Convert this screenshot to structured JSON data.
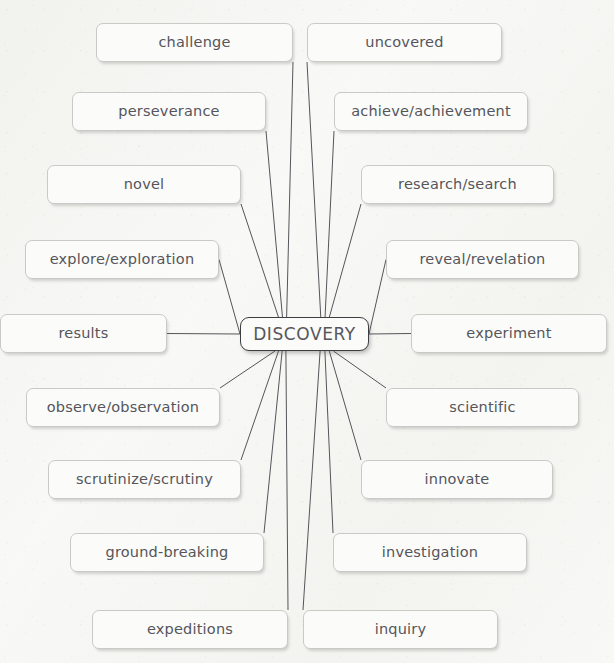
{
  "diagram": {
    "type": "mind-map",
    "background_color": "#f8f8f6",
    "node_fill": "#fbfbfa",
    "node_border": "#c9c9c6",
    "center_border": "#3e3e42",
    "text_color": "#55555a",
    "edge_color": "#55555a"
  },
  "center": {
    "label": "DISCOVERY",
    "x": 240,
    "y": 317,
    "width": 129,
    "height": 34
  },
  "nodes": [
    {
      "id": "challenge",
      "label": "challenge",
      "x": 96,
      "y": 23,
      "width": 197,
      "height": 39,
      "side": "left",
      "anchor": "bottom-right"
    },
    {
      "id": "uncovered",
      "label": "uncovered",
      "x": 307,
      "y": 23,
      "width": 195,
      "height": 39,
      "side": "right",
      "anchor": "bottom-left"
    },
    {
      "id": "perseverance",
      "label": "perseverance",
      "x": 72,
      "y": 92,
      "width": 194,
      "height": 39,
      "side": "left",
      "anchor": "bottom-right"
    },
    {
      "id": "achieve",
      "label": "achieve/achievement",
      "x": 334,
      "y": 92,
      "width": 194,
      "height": 39,
      "side": "right",
      "anchor": "bottom-left"
    },
    {
      "id": "novel",
      "label": "novel",
      "x": 47,
      "y": 165,
      "width": 194,
      "height": 39,
      "side": "left",
      "anchor": "bottom-right"
    },
    {
      "id": "research",
      "label": "research/search",
      "x": 361,
      "y": 165,
      "width": 193,
      "height": 39,
      "side": "right",
      "anchor": "bottom-left"
    },
    {
      "id": "explore",
      "label": "explore/exploration",
      "x": 25,
      "y": 240,
      "width": 194,
      "height": 39,
      "side": "left",
      "anchor": "right"
    },
    {
      "id": "reveal",
      "label": "reveal/revelation",
      "x": 386,
      "y": 240,
      "width": 193,
      "height": 39,
      "side": "right",
      "anchor": "left"
    },
    {
      "id": "results",
      "label": "results",
      "x": 0,
      "y": 314,
      "width": 167,
      "height": 39,
      "side": "left",
      "anchor": "right"
    },
    {
      "id": "experiment",
      "label": "experiment",
      "x": 411,
      "y": 314,
      "width": 196,
      "height": 39,
      "side": "right",
      "anchor": "left"
    },
    {
      "id": "observe",
      "label": "observe/observation",
      "x": 26,
      "y": 388,
      "width": 194,
      "height": 39,
      "side": "left",
      "anchor": "top-right"
    },
    {
      "id": "scientific",
      "label": "scientific",
      "x": 386,
      "y": 388,
      "width": 193,
      "height": 39,
      "side": "right",
      "anchor": "top-left"
    },
    {
      "id": "scrutinize",
      "label": "scrutinize/scrutiny",
      "x": 48,
      "y": 460,
      "width": 193,
      "height": 39,
      "side": "left",
      "anchor": "top-right"
    },
    {
      "id": "innovate",
      "label": "innovate",
      "x": 361,
      "y": 460,
      "width": 192,
      "height": 39,
      "side": "right",
      "anchor": "top-left"
    },
    {
      "id": "ground",
      "label": "ground-breaking",
      "x": 70,
      "y": 533,
      "width": 194,
      "height": 39,
      "side": "left",
      "anchor": "top-right"
    },
    {
      "id": "investigation",
      "label": "investigation",
      "x": 333,
      "y": 533,
      "width": 194,
      "height": 39,
      "side": "right",
      "anchor": "top-left"
    },
    {
      "id": "expeditions",
      "label": "expeditions",
      "x": 92,
      "y": 610,
      "width": 196,
      "height": 39,
      "side": "left",
      "anchor": "top-right"
    },
    {
      "id": "inquiry",
      "label": "inquiry",
      "x": 303,
      "y": 610,
      "width": 195,
      "height": 39,
      "side": "right",
      "anchor": "top-left"
    }
  ]
}
